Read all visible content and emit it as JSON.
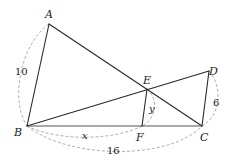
{
  "figure": {
    "type": "geometry-diagram",
    "points": {
      "A": {
        "label": "A",
        "x": 49,
        "y": 24
      },
      "B": {
        "label": "B",
        "x": 27,
        "y": 126
      },
      "C": {
        "label": "C",
        "x": 202,
        "y": 126
      },
      "D": {
        "label": "D",
        "x": 209,
        "y": 71
      },
      "E": {
        "label": "E",
        "x": 147,
        "y": 89
      },
      "F": {
        "label": "F",
        "x": 142,
        "y": 126
      }
    },
    "segments": [
      [
        "A",
        "B"
      ],
      [
        "A",
        "C"
      ],
      [
        "B",
        "C"
      ],
      [
        "B",
        "D"
      ],
      [
        "D",
        "C"
      ],
      [
        "E",
        "F"
      ]
    ],
    "measurements": {
      "AB": "10",
      "DC": "6",
      "BC": "16",
      "BF": "x",
      "EF": "y"
    }
  }
}
